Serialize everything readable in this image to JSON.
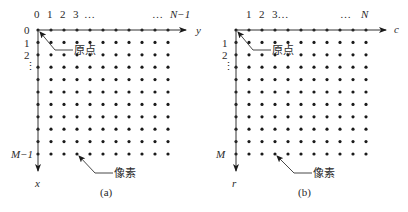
{
  "colors": {
    "ink": "#1a1a1a",
    "axis": "#333333",
    "background": "#ffffff"
  },
  "grid": {
    "cols": 11,
    "rows": 11,
    "col_spacing": 13,
    "row_spacing": 12.4,
    "dot_radius": 1.6
  },
  "panels": [
    {
      "id": "a",
      "caption": "(a)",
      "origin": [
        38,
        30
      ],
      "col_labels": [
        "0",
        "1",
        "2",
        "3",
        "…",
        "…",
        "N−1"
      ],
      "row_labels": [
        "0",
        "1",
        "2",
        "⋮"
      ],
      "bottom_row_label": "M−1",
      "h_axis_label": "y",
      "v_axis_label": "x",
      "origin_callout": "原点",
      "pixel_callout": "像素"
    },
    {
      "id": "b",
      "caption": "(b)",
      "origin": [
        236,
        30
      ],
      "col_labels": [
        "",
        "1",
        "2",
        "3…",
        "",
        "…",
        "N"
      ],
      "row_labels": [
        "",
        "1",
        "2",
        "⋮"
      ],
      "bottom_row_label": "M",
      "h_axis_label": "c",
      "v_axis_label": "r",
      "origin_callout": "原点",
      "pixel_callout": "像素"
    }
  ]
}
